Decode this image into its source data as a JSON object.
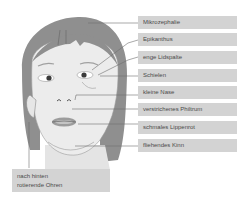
{
  "diagram": {
    "colors": {
      "hair": "#8f8f8f",
      "skin": "#ececec",
      "label_bg": "#d3d3d3",
      "label_text": "#4a4a4a",
      "leader_line": "#6e6e6e"
    },
    "labels": [
      {
        "id": "mikrozephalie",
        "text": "Mikrozephalie"
      },
      {
        "id": "epikanthus",
        "text": "Epikanthus"
      },
      {
        "id": "enge-lidspalte",
        "text": "enge Lidspalte"
      },
      {
        "id": "schielen",
        "text": "Schielen"
      },
      {
        "id": "kleine-nase",
        "text": "kleine Nase"
      },
      {
        "id": "verstrichenes-philtrum",
        "text": "verstrichenes Philtrum"
      },
      {
        "id": "schmales-lippenrot",
        "text": "schmales Lippenrot"
      },
      {
        "id": "fliehendes-kinn",
        "text": "fliehendes Kinn"
      }
    ],
    "ear_label": {
      "line1": "nach hinten",
      "line2": "rotierende Ohren"
    }
  }
}
